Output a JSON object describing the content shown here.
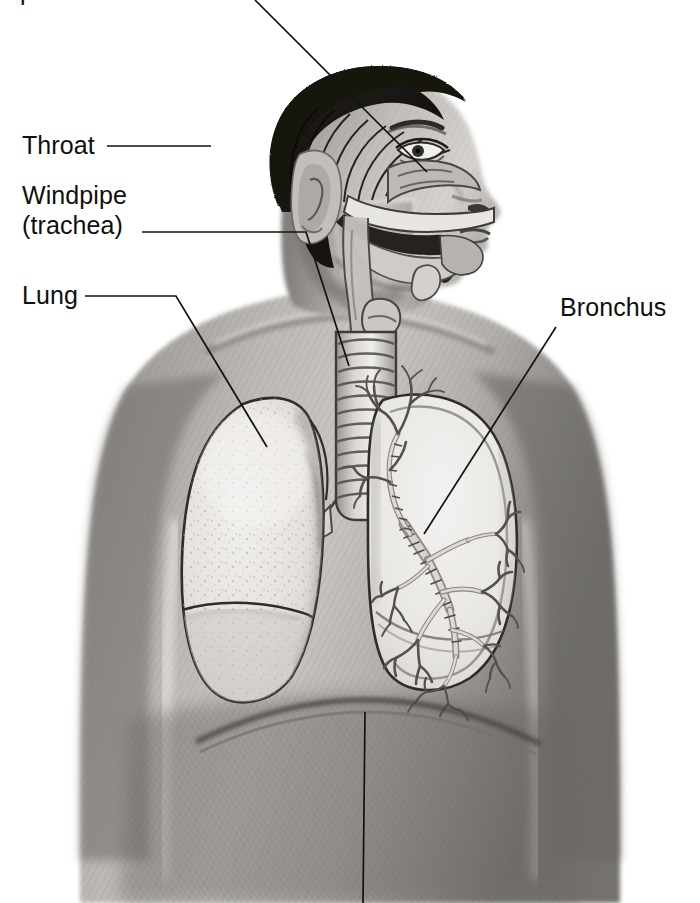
{
  "document": {
    "type": "anatomical-illustration",
    "subject": "Human respiratory system",
    "medium": "pencil drawing",
    "view": "boy, head in profile facing right, torso front-facing, chest cut away",
    "background_color": "#ffffff",
    "ink_color": "#100f0d",
    "width": 700,
    "height": 903
  },
  "labels": {
    "clipped_top": "p",
    "throat": "Throat",
    "windpipe_line1": "Windpipe",
    "windpipe_line2": "(trachea)",
    "lung": "Lung",
    "bronchus": "Bronchus"
  },
  "leaders": [
    {
      "name": "nasal-cavity-leader",
      "label": "",
      "note": "enters from top edge, clipped label above frame",
      "from": [
        255,
        0
      ],
      "to": [
        427,
        172
      ]
    },
    {
      "name": "throat-leader",
      "label": "Throat",
      "from": [
        107,
        146
      ],
      "to": [
        211,
        146
      ]
    },
    {
      "name": "windpipe-leader",
      "label": "Windpipe (trachea)",
      "from": [
        142,
        232
      ],
      "to": [
        349,
        366
      ],
      "bend": [
        306,
        232
      ]
    },
    {
      "name": "lung-leader",
      "label": "Lung",
      "from": [
        85,
        296
      ],
      "to": [
        267,
        447
      ],
      "bend": [
        176,
        296
      ]
    },
    {
      "name": "bronchus-leader",
      "label": "Bronchus",
      "from": [
        556,
        327
      ],
      "to": [
        424,
        534
      ]
    },
    {
      "name": "diaphragm-leader",
      "label": "",
      "note": "descends from diaphragm to bottom edge, label clipped below frame",
      "from": [
        365,
        712
      ],
      "to": [
        363,
        903
      ]
    }
  ],
  "anatomy_parts": [
    {
      "name": "nasal-cavity",
      "labeled_by": "clipped top label"
    },
    {
      "name": "throat",
      "labeled_by": "Throat"
    },
    {
      "name": "trachea",
      "labeled_by": "Windpipe (trachea)"
    },
    {
      "name": "lung-left",
      "labeled_by": "Lung"
    },
    {
      "name": "lung-right-cutaway",
      "labeled_by": "Bronchus"
    },
    {
      "name": "bronchial-tree",
      "labeled_by": "Bronchus"
    },
    {
      "name": "diaphragm",
      "labeled_by": "clipped bottom label"
    }
  ]
}
